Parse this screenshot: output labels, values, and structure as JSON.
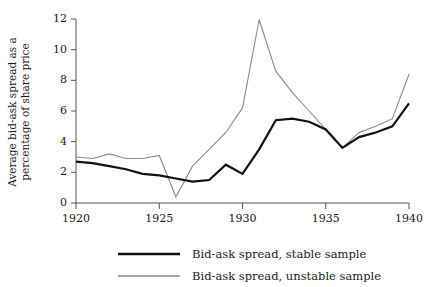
{
  "chart_data": {
    "type": "line",
    "title": "",
    "xlabel": "",
    "ylabel": "Average bid-ask spread as a percentage of share price",
    "ylabel_line1": "Average bid-ask spread as a",
    "ylabel_line2": "percentage of share price",
    "xlim": [
      1920,
      1940
    ],
    "ylim": [
      0,
      12
    ],
    "xticks": [
      1920,
      1925,
      1930,
      1935,
      1940
    ],
    "xtick_labels": [
      "1920",
      "1925",
      "1930",
      "1935",
      "1940"
    ],
    "yticks": [
      0,
      2,
      4,
      6,
      8,
      10,
      12
    ],
    "ytick_labels": [
      "0",
      "2",
      "4",
      "6",
      "8",
      "10",
      "12"
    ],
    "grid": false,
    "legend_position": "below",
    "x": [
      1920,
      1921,
      1922,
      1923,
      1924,
      1925,
      1926,
      1927,
      1928,
      1929,
      1930,
      1931,
      1932,
      1933,
      1934,
      1935,
      1936,
      1937,
      1938,
      1939,
      1940
    ],
    "series": [
      {
        "name": "Bid-ask spread, stable sample",
        "color": "#111111",
        "width": 2.2,
        "values": [
          2.7,
          2.6,
          2.4,
          2.2,
          1.9,
          1.8,
          1.6,
          1.4,
          1.5,
          2.5,
          1.9,
          3.5,
          5.4,
          5.5,
          5.3,
          4.8,
          3.6,
          4.3,
          4.6,
          5.0,
          6.5
        ]
      },
      {
        "name": "Bid-ask spread, unstable sample",
        "color": "#8a8a8a",
        "width": 1.1,
        "values": [
          3.0,
          2.9,
          3.2,
          2.9,
          2.9,
          3.1,
          0.4,
          2.4,
          3.5,
          4.6,
          6.2,
          11.95,
          8.6,
          7.2,
          6.0,
          4.8,
          3.6,
          4.6,
          5.0,
          5.5,
          8.4
        ]
      }
    ],
    "annotations": []
  },
  "legend": {
    "items": [
      {
        "label": "Bid-ask spread, stable sample",
        "color": "#111111",
        "width": 2.6
      },
      {
        "label": "Bid-ask spread, unstable sample",
        "color": "#8a8a8a",
        "width": 1.3
      }
    ]
  }
}
